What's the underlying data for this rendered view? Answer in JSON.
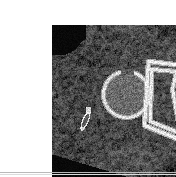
{
  "page": {
    "background_color": "#ffffff",
    "width": 176,
    "height": 177
  },
  "figure": {
    "name": "axial-ct-hip-pelvis",
    "modality_label": "CT",
    "caption": "",
    "plate_rect": {
      "x": 12,
      "y": 9,
      "width": 154,
      "height": 158
    },
    "background_color": "#000000",
    "window": {
      "level_label": "bone/soft-tissue blend"
    }
  },
  "anatomy": {
    "structures": [
      {
        "name": "subcutaneous-fat-and-skin-contour",
        "brightness": "dark-mid",
        "note": "curved body wall occupying left and upper portion of frame"
      },
      {
        "name": "gluteal-and-thigh-musculature",
        "brightness": "mid-gray",
        "note": "speckled soft tissue with fascial planes"
      },
      {
        "name": "femoral-head",
        "brightness": "mid-gray with bright cortical rim",
        "center_x": 86,
        "center_y": 78,
        "radius": 23
      },
      {
        "name": "acetabulum-cortical-arc",
        "brightness": "bright-white"
      },
      {
        "name": "superior-pubic-ramus",
        "brightness": "bright-white"
      },
      {
        "name": "ischial-ramus",
        "brightness": "bright-white"
      },
      {
        "name": "pelvic-bone-triangle",
        "brightness": "bright-white",
        "note": "thin hyperdense cortical outline forming triangular ring right of femoral head"
      },
      {
        "name": "small-cortical-fragment",
        "brightness": "bright-white",
        "center_x": 48,
        "center_y": 103,
        "note": "elongated bright sliver in left lateral soft tissue"
      },
      {
        "name": "air-background-wedge",
        "brightness": "black",
        "note": "dark wedge across lower-left outside the body"
      },
      {
        "name": "air-background-corner",
        "brightness": "black",
        "note": "dark corner at upper-left outside the body"
      }
    ]
  },
  "footer": {
    "rule_color": "#b9b9b9",
    "rule_color_secondary": "#dcdcdc"
  },
  "colors": {
    "page_bg": "#ffffff",
    "plate_bg": "#000000",
    "bone_bright": "#f2f2ee",
    "soft_tissue": "#6e6e6e",
    "fat": "#3c3c3c"
  }
}
